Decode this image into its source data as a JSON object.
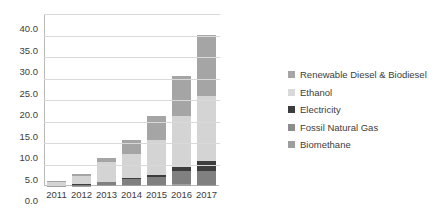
{
  "chart_data": {
    "type": "bar",
    "subtype": "stacked-column",
    "title": "",
    "subtitle": "",
    "xlabel": "",
    "ylabel": "",
    "categories": [
      "2011",
      "2012",
      "2013",
      "2014",
      "2015",
      "2016",
      "2017"
    ],
    "ylim": [
      0,
      40
    ],
    "ytick_step": 5,
    "ytick_labels": [
      "0.0",
      "5.0",
      "10.0",
      "15.0",
      "20.0",
      "25.0",
      "30.0",
      "35.0",
      "40.0"
    ],
    "ytick_values": [
      0,
      5,
      10,
      15,
      20,
      25,
      30,
      35,
      40
    ],
    "grid": true,
    "grid_axis": "y",
    "legend_position": "right",
    "stack_order_bottom_to_top": [
      "Biomethane",
      "Fossil Natural Gas",
      "Electricity",
      "Ethanol",
      "Renewable Diesel & Biodiesel"
    ],
    "series": [
      {
        "name": "Renewable Diesel & Biodiesel",
        "color": "#a5a5a5",
        "values": [
          0.2,
          0.5,
          1.0,
          3.3,
          5.7,
          9.2,
          14.2
        ]
      },
      {
        "name": "Ethanol",
        "color": "#d4d4d4",
        "values": [
          0.9,
          1.9,
          4.5,
          5.6,
          8.0,
          11.8,
          15.1
        ]
      },
      {
        "name": "Electricity",
        "color": "#3d3d3d",
        "values": [
          0.0,
          0.05,
          0.15,
          0.35,
          0.6,
          0.9,
          2.4
        ]
      },
      {
        "name": "Fossil Natural Gas",
        "color": "#808080",
        "values": [
          0.08,
          0.3,
          0.7,
          1.3,
          1.7,
          3.2,
          3.2
        ]
      },
      {
        "name": "Biomethane",
        "color": "#a0a0a0",
        "values": [
          0.02,
          0.05,
          0.15,
          0.25,
          0.3,
          0.4,
          0.3
        ]
      }
    ],
    "totals": [
      1.2,
      2.8,
      6.5,
      10.8,
      16.3,
      25.5,
      35.2
    ]
  },
  "legend": {
    "items": [
      {
        "label": "Renewable Diesel & Biodiesel",
        "color": "#a5a5a5"
      },
      {
        "label": "Ethanol",
        "color": "#d9d9d9"
      },
      {
        "label": "Electricity",
        "color": "#3d3d3d"
      },
      {
        "label": "Fossil Natural Gas",
        "color": "#8c8c8c"
      },
      {
        "label": "Biomethane",
        "color": "#9e9e9e"
      }
    ]
  },
  "axes": {
    "y_min_label": "0.0",
    "y_max_label": "40.0"
  }
}
